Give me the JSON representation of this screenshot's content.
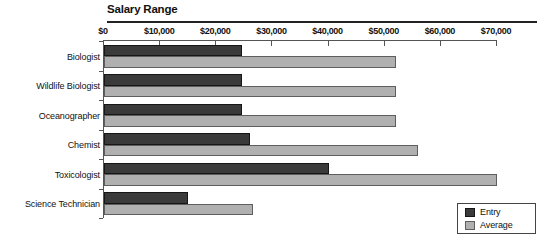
{
  "chart_data": {
    "type": "bar",
    "orientation": "horizontal",
    "title": "Salary Range",
    "categories": [
      "Biologist",
      "Wildlife Biologist",
      "Oceanographer",
      "Chemist",
      "Toxicologist",
      "Science Technician"
    ],
    "series": [
      {
        "name": "Entry",
        "color": "#3a3a3a",
        "border_color": "#161616",
        "values": [
          24500,
          24500,
          24500,
          26000,
          40000,
          15000
        ]
      },
      {
        "name": "Average",
        "color": "#b0b0b0",
        "border_color": "#5e5e5e",
        "values": [
          52000,
          52000,
          52000,
          56000,
          70000,
          26500
        ]
      }
    ],
    "xlim": [
      0,
      70000
    ],
    "x_ticks": [
      {
        "value": 0,
        "label": "$0"
      },
      {
        "value": 10000,
        "label": "$10,000"
      },
      {
        "value": 20000,
        "label": "$20,000"
      },
      {
        "value": 30000,
        "label": "$30,000"
      },
      {
        "value": 40000,
        "label": "$40,000"
      },
      {
        "value": 50000,
        "label": "$50,000"
      },
      {
        "value": 60000,
        "label": "$60,000"
      },
      {
        "value": 70000,
        "label": "$70,000"
      }
    ],
    "grid": false,
    "legend_position": "bottom-right"
  }
}
